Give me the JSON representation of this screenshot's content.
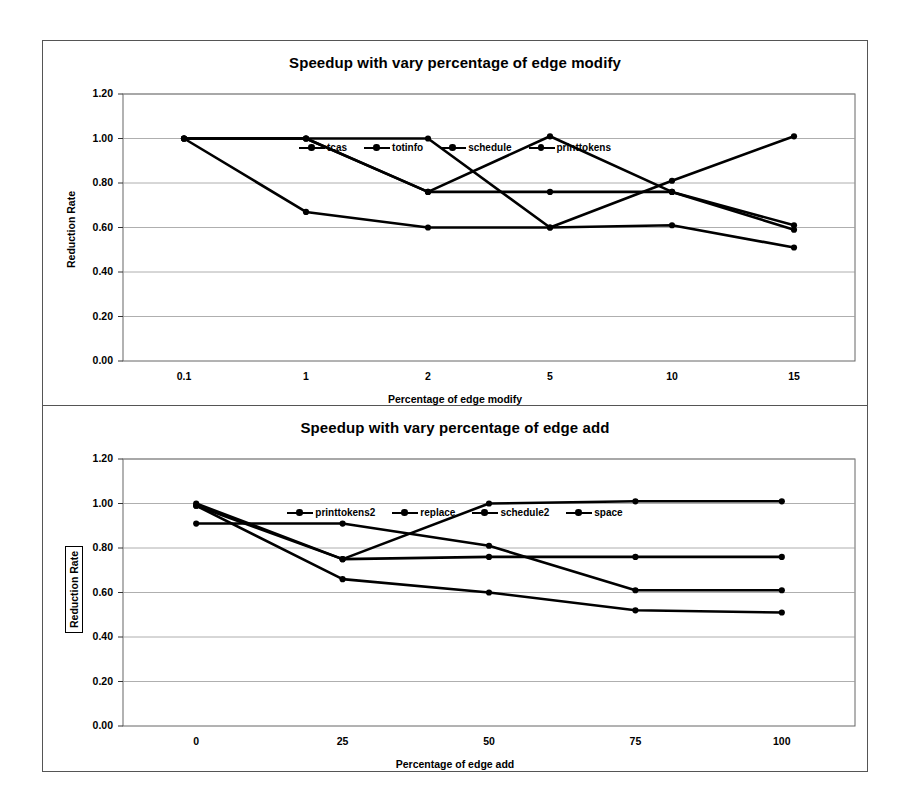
{
  "figure": {
    "background_color": "#ffffff",
    "line_color": "#000000",
    "grid_color": "#9a9a9a",
    "frame_color": "#555555"
  },
  "charts": [
    {
      "id": "edge-modify",
      "title": "Speedup with vary percentage of edge modify",
      "xlabel": "Percentage of edge modify",
      "ylabel": "Reduction Rate",
      "ylabel_boxed": false,
      "yticks": [
        "0.00",
        "0.20",
        "0.40",
        "0.60",
        "0.80",
        "1.00",
        "1.20"
      ],
      "xticks": [
        "0.1",
        "1",
        "2",
        "5",
        "10",
        "15"
      ],
      "legend": [
        {
          "label": "tcas",
          "marker": "circle-line"
        },
        {
          "label": "totinfo",
          "marker": "circle-line"
        },
        {
          "label": "schedule",
          "marker": "circle-line"
        },
        {
          "label": "printtokens",
          "marker": "circle-line"
        }
      ]
    },
    {
      "id": "edge-add",
      "title": "Speedup with vary percentage of edge add",
      "xlabel": "Percentage of edge add",
      "ylabel": "Reduction Rate",
      "ylabel_boxed": true,
      "yticks": [
        "0.00",
        "0.20",
        "0.40",
        "0.60",
        "0.80",
        "1.00",
        "1.20"
      ],
      "xticks": [
        "0",
        "25",
        "50",
        "75",
        "100"
      ],
      "legend": [
        {
          "label": "printtokens2",
          "marker": "circle-line"
        },
        {
          "label": "replace",
          "marker": "circle-line"
        },
        {
          "label": "schedule2",
          "marker": "circle-line"
        },
        {
          "label": "space",
          "marker": "circle-line"
        }
      ]
    }
  ],
  "chart_data": [
    {
      "type": "line",
      "title": "Speedup with vary percentage of edge modify",
      "xlabel": "Percentage of edge modify",
      "ylabel": "Reduction Rate",
      "categories": [
        "0.1",
        "1",
        "2",
        "5",
        "10",
        "15"
      ],
      "ylim": [
        0.0,
        1.2
      ],
      "ytick_step": 0.2,
      "grid": true,
      "legend_position": "top-inside",
      "series": [
        {
          "name": "tcas",
          "values": [
            1.0,
            0.67,
            0.6,
            0.6,
            0.61,
            0.51
          ]
        },
        {
          "name": "totinfo",
          "values": [
            1.0,
            1.0,
            0.76,
            1.01,
            0.76,
            0.59
          ]
        },
        {
          "name": "schedule",
          "values": [
            1.0,
            1.0,
            0.76,
            0.76,
            0.76,
            0.61
          ]
        },
        {
          "name": "printtokens",
          "values": [
            1.0,
            1.0,
            1.0,
            0.6,
            0.81,
            1.01
          ]
        }
      ]
    },
    {
      "type": "line",
      "title": "Speedup with vary percentage of edge add",
      "xlabel": "Percentage of edge add",
      "ylabel": "Reduction Rate",
      "categories": [
        "0",
        "25",
        "50",
        "75",
        "100"
      ],
      "ylim": [
        0.0,
        1.2
      ],
      "ytick_step": 0.2,
      "grid": true,
      "legend_position": "top-inside",
      "series": [
        {
          "name": "printtokens2",
          "values": [
            0.99,
            0.75,
            1.0,
            1.01,
            1.01
          ]
        },
        {
          "name": "replace",
          "values": [
            0.91,
            0.91,
            0.81,
            0.61,
            0.61
          ]
        },
        {
          "name": "schedule2",
          "values": [
            1.0,
            0.75,
            0.76,
            0.76,
            0.76
          ]
        },
        {
          "name": "space",
          "values": [
            0.99,
            0.66,
            0.6,
            0.52,
            0.51
          ]
        }
      ]
    }
  ]
}
